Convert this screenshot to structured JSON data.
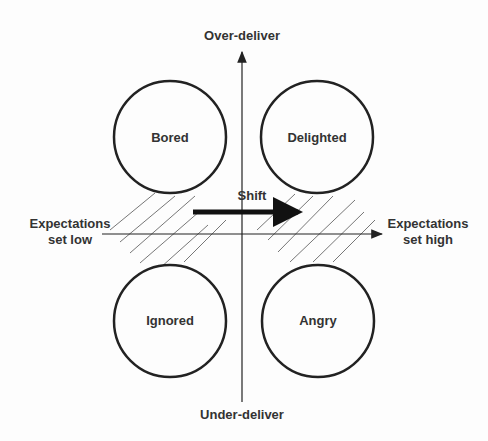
{
  "axes": {
    "top": "Over-deliver",
    "bottom": "Under-deliver",
    "left_line1": "Expectations",
    "left_line2": "set low",
    "right_line1": "Expectations",
    "right_line2": "set high"
  },
  "quadrants": {
    "top_left": "Bored",
    "top_right": "Delighted",
    "bottom_left": "Ignored",
    "bottom_right": "Angry"
  },
  "shift_label": "Shift",
  "colors": {
    "line": "#222222",
    "text": "#333333",
    "hatch": "#777777"
  }
}
